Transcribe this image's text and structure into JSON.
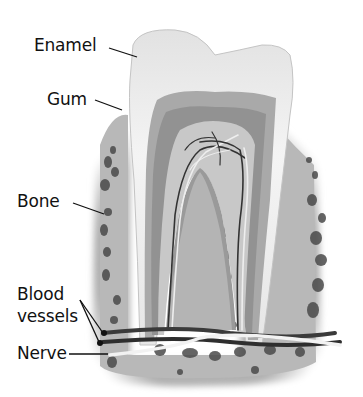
{
  "labels": {
    "enamel": "Enamel",
    "gum": "Gum",
    "bone": "Bone",
    "blood_vessels_line1": "Blood",
    "blood_vessels_line2": "vessels",
    "nerve": "Nerve"
  },
  "colors": {
    "background": "#ffffff",
    "enamel": "#eeeeee",
    "dentin_outer": "#a8a8a8",
    "dentin_inner": "#8f8f8f",
    "pulp": "#c9c9c9",
    "gum_bone": "#b5b5b5",
    "bone_holes": "#4a4a4a",
    "vessel": "#333333",
    "nerve": "#f2f2f2",
    "leader_line": "#111111",
    "text": "#111111"
  }
}
